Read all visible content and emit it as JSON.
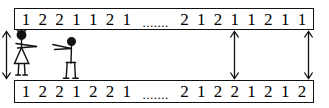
{
  "diagram": {
    "ink_color": "#111111",
    "background_color": "#ffffff",
    "ellipsis": ".......",
    "sequences": [
      {
        "name": "top-sequence",
        "left_digits": [
          "1",
          "2",
          "2",
          "1",
          "1",
          "2",
          "1"
        ],
        "right_digits": [
          "2",
          "1",
          "2",
          "1",
          "1",
          "2",
          "1",
          "1"
        ]
      },
      {
        "name": "bottom-sequence",
        "left_digits": [
          "1",
          "2",
          "2",
          "1",
          "2",
          "2",
          "1"
        ],
        "right_digits": [
          "2",
          "1",
          "2",
          "2",
          "1",
          "2",
          "1",
          "2"
        ]
      }
    ],
    "arrows": [
      {
        "name": "comparison-arrow-1",
        "x": 88,
        "label": "double-headed-vertical-arrow"
      },
      {
        "name": "comparison-arrow-2",
        "x": 228,
        "label": "double-headed-vertical-arrow"
      },
      {
        "name": "comparison-arrow-3",
        "x": 302,
        "label": "double-headed-vertical-arrow"
      }
    ],
    "figures": [
      {
        "name": "stick-figure-woman",
        "icon": "person-woman-pointing-icon"
      },
      {
        "name": "stick-figure-man",
        "icon": "person-man-pointing-icon"
      }
    ]
  }
}
